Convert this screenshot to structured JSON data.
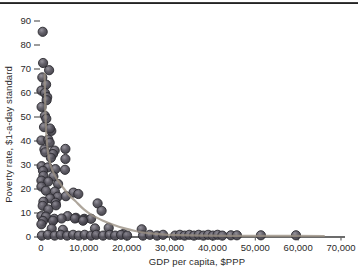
{
  "figure": {
    "background": "#ffffff",
    "top_rule_color": "#1c1c1c",
    "axis_color": "#3b3b3b",
    "tick_color": "#4b4b4b",
    "text_color": "#2a2a2a"
  },
  "chart_data": {
    "type": "scatter",
    "title": "",
    "xlabel": "GDP per capita, $PPP",
    "ylabel": "Poverty rate, $1-a-day standard",
    "xlim": [
      0,
      70000
    ],
    "ylim": [
      0,
      90
    ],
    "grid": false,
    "legend": "none",
    "x_tick_values": [
      0,
      10000,
      20000,
      30000,
      40000,
      50000,
      60000,
      70000
    ],
    "x_tick_labels": [
      "0",
      "10,000",
      "20,000",
      "30,000",
      "40,000",
      "50,000",
      "60,000",
      "70,000"
    ],
    "y_tick_values": [
      0,
      10,
      20,
      30,
      40,
      50,
      60,
      70,
      80,
      90
    ],
    "y_tick_labels": [
      "0",
      "10",
      "20",
      "30",
      "40",
      "50",
      "60",
      "70",
      "80",
      "90"
    ],
    "series": [
      {
        "name": "country-observations",
        "type": "scatter",
        "marker": "circle",
        "color": "#4a4850",
        "edge_color": "#2b2a30",
        "points": [
          [
            400,
            85.5
          ],
          [
            500,
            72.5
          ],
          [
            1900,
            69.5
          ],
          [
            300,
            66.5
          ],
          [
            1200,
            63.5
          ],
          [
            100,
            61
          ],
          [
            900,
            60
          ],
          [
            1450,
            58.3
          ],
          [
            1300,
            57
          ],
          [
            150,
            54.2
          ],
          [
            900,
            50.5
          ],
          [
            1240,
            49.3
          ],
          [
            700,
            45.8
          ],
          [
            2400,
            44.2
          ],
          [
            2100,
            45.2
          ],
          [
            100,
            40.2
          ],
          [
            1700,
            40.6
          ],
          [
            2030,
            39.3
          ],
          [
            800,
            36.5
          ],
          [
            1000,
            35.3
          ],
          [
            3200,
            36
          ],
          [
            5700,
            36.7
          ],
          [
            2800,
            34.6
          ],
          [
            2300,
            33
          ],
          [
            5700,
            32.5
          ],
          [
            150,
            29.5
          ],
          [
            1630,
            29
          ],
          [
            3350,
            28.3
          ],
          [
            5600,
            28
          ],
          [
            470,
            27.6
          ],
          [
            550,
            25.5
          ],
          [
            2900,
            25.2
          ],
          [
            100,
            23.5
          ],
          [
            1700,
            23.1
          ],
          [
            4000,
            22.1
          ],
          [
            100,
            21
          ],
          [
            1150,
            19.3
          ],
          [
            3250,
            18.9
          ],
          [
            7550,
            18.5
          ],
          [
            8700,
            17.9
          ],
          [
            3900,
            16.8
          ],
          [
            5800,
            17
          ],
          [
            2100,
            16.1
          ],
          [
            550,
            14.7
          ],
          [
            3400,
            14.3
          ],
          [
            13200,
            14
          ],
          [
            400,
            13
          ],
          [
            3500,
            13.2
          ],
          [
            14150,
            10.9
          ],
          [
            1700,
            11.5
          ],
          [
            100,
            8.7
          ],
          [
            1150,
            8.5
          ],
          [
            3100,
            7.6
          ],
          [
            6200,
            8.7
          ],
          [
            8150,
            8
          ],
          [
            10100,
            7.6
          ],
          [
            4800,
            7.7
          ],
          [
            7900,
            7.7
          ],
          [
            9900,
            7.3
          ],
          [
            11700,
            7.6
          ],
          [
            470,
            6.7
          ],
          [
            2800,
            6.8
          ],
          [
            9800,
            6.8
          ],
          [
            100,
            5.3
          ],
          [
            12600,
            3.6
          ],
          [
            23500,
            3.2
          ],
          [
            2500,
            3.5
          ],
          [
            5100,
            3
          ],
          [
            15800,
            3.8
          ],
          [
            19200,
            1.2
          ],
          [
            200,
            0.6
          ],
          [
            1600,
            0.9
          ],
          [
            3200,
            0.6
          ],
          [
            4600,
            0.9
          ],
          [
            6100,
            0.6
          ],
          [
            7500,
            0.9
          ],
          [
            8800,
            0.6
          ],
          [
            10200,
            0.9
          ],
          [
            11700,
            0.6
          ],
          [
            12900,
            0.9
          ],
          [
            14500,
            0.6
          ],
          [
            16000,
            0.9
          ],
          [
            17300,
            0.6
          ],
          [
            18700,
            0.9
          ],
          [
            20100,
            0.6
          ],
          [
            23800,
            0.6
          ],
          [
            25400,
            0.9
          ],
          [
            27100,
            0.6
          ],
          [
            28500,
            0.9
          ],
          [
            31300,
            0.6
          ],
          [
            32400,
            0.9
          ],
          [
            33500,
            0.6
          ],
          [
            34600,
            0.9
          ],
          [
            35700,
            0.6
          ],
          [
            36800,
            0.9
          ],
          [
            37900,
            0.6
          ],
          [
            39000,
            0.9
          ],
          [
            40100,
            0.6
          ],
          [
            41200,
            0.9
          ],
          [
            42300,
            0.6
          ],
          [
            44300,
            0.7
          ],
          [
            45700,
            0.7
          ],
          [
            51300,
            0.7
          ],
          [
            59500,
            0.7
          ]
        ]
      },
      {
        "name": "fitted-trend",
        "type": "line",
        "color": "#9a9083",
        "points": [
          [
            850,
            68
          ],
          [
            950,
            58
          ],
          [
            1100,
            48
          ],
          [
            1400,
            39
          ],
          [
            1900,
            32.5
          ],
          [
            2600,
            28
          ],
          [
            3600,
            24.5
          ],
          [
            5000,
            21
          ],
          [
            6500,
            17.5
          ],
          [
            8000,
            15
          ],
          [
            10000,
            11.5
          ],
          [
            12000,
            9
          ],
          [
            14500,
            6.8
          ],
          [
            17000,
            5
          ],
          [
            19500,
            3.6
          ],
          [
            22000,
            2.5
          ],
          [
            25000,
            1.6
          ],
          [
            28000,
            1.1
          ],
          [
            32000,
            0.8
          ],
          [
            38000,
            0.6
          ],
          [
            45000,
            0.5
          ],
          [
            55000,
            0.45
          ],
          [
            66000,
            0.4
          ]
        ]
      }
    ]
  }
}
